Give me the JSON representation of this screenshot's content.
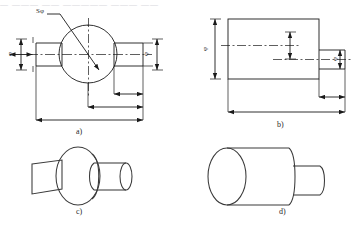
{
  "figure": {
    "title_strip": "— ——— —— ————— ——— ——",
    "background_color": "#ffffff",
    "line_color": "#1a1a1a",
    "center_line_color": "#1a1a1a",
    "caption_color": "#2a2a2a"
  },
  "panels": [
    {
      "id": "a",
      "caption": "a)",
      "type": "orthographic-section",
      "description": "Front view of a sphere with two coaxial cylinders, one each side",
      "dimensions": [
        {
          "name": "sphere-diameter",
          "label": "Sφ",
          "orientation": "leader",
          "position": "upper-left"
        },
        {
          "name": "left-cylinder-diameter",
          "label": "φ",
          "orientation": "vertical",
          "position": "left"
        },
        {
          "name": "right-cylinder-diameter",
          "label": "φ",
          "orientation": "vertical",
          "position": "right"
        },
        {
          "name": "right-cylinder-length",
          "label": "",
          "orientation": "horizontal",
          "position": "bottom-1"
        },
        {
          "name": "sphere-to-right-end",
          "label": "",
          "orientation": "horizontal",
          "position": "bottom-2"
        },
        {
          "name": "overall-length",
          "label": "",
          "orientation": "horizontal",
          "position": "bottom-3"
        }
      ]
    },
    {
      "id": "b",
      "caption": "b)",
      "type": "orthographic-section",
      "description": "Front view of a large cylinder with a smaller coaxial cylinder on the right",
      "dimensions": [
        {
          "name": "large-cylinder-diameter",
          "label": "φ",
          "orientation": "vertical",
          "position": "left"
        },
        {
          "name": "small-cylinder-diameter",
          "label": "φ",
          "orientation": "vertical",
          "position": "right"
        },
        {
          "name": "inner-vertical-dim",
          "label": "",
          "orientation": "vertical",
          "position": "center"
        },
        {
          "name": "small-cylinder-length",
          "label": "",
          "orientation": "horizontal",
          "position": "bottom-1"
        },
        {
          "name": "overall-length",
          "label": "",
          "orientation": "horizontal",
          "position": "bottom-2"
        }
      ]
    },
    {
      "id": "c",
      "caption": "c)",
      "type": "pictorial",
      "description": "Isometric pictorial of the sphere with two coaxial cylinders"
    },
    {
      "id": "d",
      "caption": "d)",
      "type": "pictorial",
      "description": "Isometric pictorial of the large cylinder with small coaxial cylinder"
    }
  ]
}
